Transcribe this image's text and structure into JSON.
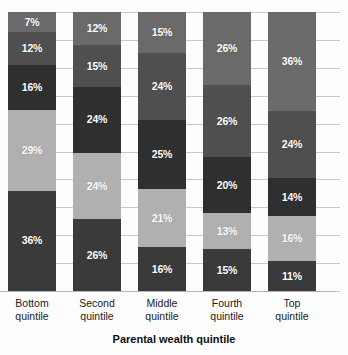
{
  "chart_data": {
    "type": "bar",
    "subtype": "stacked-100-percent",
    "title": "",
    "subtitle": "",
    "xlabel": "Parental wealth quintile",
    "ylabel": "",
    "ylim": [
      0,
      100
    ],
    "grid": true,
    "legend": "none",
    "gridline_values": [
      0,
      10,
      20,
      30,
      40,
      50,
      60,
      70,
      80,
      90,
      100
    ],
    "categories": [
      "Bottom quintile",
      "Second quintile",
      "Middle quintile",
      "Fourth quintile",
      "Top quintile"
    ],
    "category_lines": [
      [
        "Bottom",
        "quintile"
      ],
      [
        "Second",
        "quintile"
      ],
      [
        "Middle",
        "quintile"
      ],
      [
        "Fourth",
        "quintile"
      ],
      [
        "Top",
        "quintile"
      ]
    ],
    "series": [
      {
        "name": "Series 1",
        "color": "#3a3a3a",
        "values": [
          36,
          26,
          16,
          15,
          11
        ]
      },
      {
        "name": "Series 2",
        "color": "#b0b0b0",
        "values": [
          29,
          24,
          21,
          13,
          16
        ]
      },
      {
        "name": "Series 3",
        "color": "#2f2f2f",
        "values": [
          16,
          24,
          25,
          20,
          14
        ]
      },
      {
        "name": "Series 4",
        "color": "#4f4f4f",
        "values": [
          12,
          15,
          24,
          26,
          24
        ]
      },
      {
        "name": "Series 5",
        "color": "#6a6a6a",
        "values": [
          7,
          12,
          15,
          26,
          36
        ]
      }
    ],
    "bars": [
      {
        "category": "Bottom quintile",
        "segments_top_to_bottom": [
          {
            "label": "7%",
            "value": 7,
            "color": "#6a6a6a",
            "tone": "dark"
          },
          {
            "label": "12%",
            "value": 12,
            "color": "#4f4f4f",
            "tone": "dark"
          },
          {
            "label": "16%",
            "value": 16,
            "color": "#2f2f2f",
            "tone": "dark"
          },
          {
            "label": "29%",
            "value": 29,
            "color": "#b0b0b0",
            "tone": "light"
          },
          {
            "label": "36%",
            "value": 36,
            "color": "#3a3a3a",
            "tone": "dark"
          }
        ]
      },
      {
        "category": "Second quintile",
        "segments_top_to_bottom": [
          {
            "label": "12%",
            "value": 12,
            "color": "#6a6a6a",
            "tone": "dark"
          },
          {
            "label": "15%",
            "value": 15,
            "color": "#4f4f4f",
            "tone": "dark"
          },
          {
            "label": "24%",
            "value": 24,
            "color": "#2f2f2f",
            "tone": "dark"
          },
          {
            "label": "24%",
            "value": 24,
            "color": "#b0b0b0",
            "tone": "light"
          },
          {
            "label": "26%",
            "value": 26,
            "color": "#3a3a3a",
            "tone": "dark"
          }
        ]
      },
      {
        "category": "Middle quintile",
        "segments_top_to_bottom": [
          {
            "label": "15%",
            "value": 15,
            "color": "#6a6a6a",
            "tone": "dark"
          },
          {
            "label": "24%",
            "value": 24,
            "color": "#4f4f4f",
            "tone": "dark"
          },
          {
            "label": "25%",
            "value": 25,
            "color": "#2f2f2f",
            "tone": "dark"
          },
          {
            "label": "21%",
            "value": 21,
            "color": "#b0b0b0",
            "tone": "light"
          },
          {
            "label": "16%",
            "value": 16,
            "color": "#3a3a3a",
            "tone": "dark"
          }
        ]
      },
      {
        "category": "Fourth quintile",
        "segments_top_to_bottom": [
          {
            "label": "26%",
            "value": 26,
            "color": "#6a6a6a",
            "tone": "dark"
          },
          {
            "label": "26%",
            "value": 26,
            "color": "#4f4f4f",
            "tone": "dark"
          },
          {
            "label": "20%",
            "value": 20,
            "color": "#2f2f2f",
            "tone": "dark"
          },
          {
            "label": "13%",
            "value": 13,
            "color": "#b0b0b0",
            "tone": "light"
          },
          {
            "label": "15%",
            "value": 15,
            "color": "#3a3a3a",
            "tone": "dark"
          }
        ]
      },
      {
        "category": "Top quintile",
        "segments_top_to_bottom": [
          {
            "label": "36%",
            "value": 36,
            "color": "#6a6a6a",
            "tone": "dark"
          },
          {
            "label": "24%",
            "value": 24,
            "color": "#4f4f4f",
            "tone": "dark"
          },
          {
            "label": "14%",
            "value": 14,
            "color": "#2f2f2f",
            "tone": "dark"
          },
          {
            "label": "16%",
            "value": 16,
            "color": "#b0b0b0",
            "tone": "light"
          },
          {
            "label": "11%",
            "value": 11,
            "color": "#3a3a3a",
            "tone": "dark"
          }
        ]
      }
    ],
    "colors": {
      "segment_medium": "#6a6a6a",
      "segment_dark_medium": "#4f4f4f",
      "segment_darkest": "#2f2f2f",
      "segment_light": "#b0b0b0",
      "segment_dark": "#3a3a3a",
      "gridline": "#c8c8c8",
      "axis_line": "#b4b4b4",
      "label_text": "#1a1a1a",
      "value_text": "#ffffff",
      "background": "#fdfdfd"
    }
  }
}
